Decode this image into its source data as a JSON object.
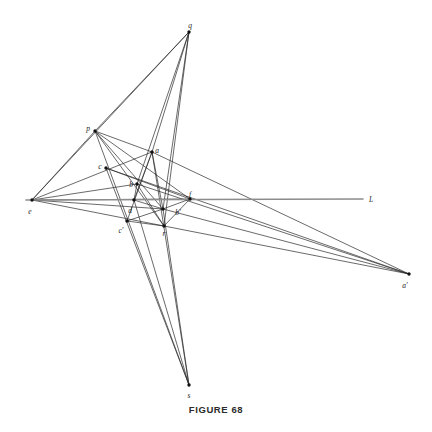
{
  "figure": {
    "caption": "FIGURE 68",
    "background_color": "#ffffff",
    "stroke_color": "#2a2a2a",
    "baseline_color": "#8c8c8c",
    "node_color": "#111111",
    "width": 432,
    "height": 432
  },
  "points": [
    {
      "id": "q",
      "label": "q",
      "x": 189,
      "y": 32,
      "lx": 190,
      "ly": 25
    },
    {
      "id": "p",
      "label": "p",
      "x": 95,
      "y": 131,
      "lx": 88,
      "ly": 128
    },
    {
      "id": "a",
      "label": "a",
      "x": 152,
      "y": 152,
      "lx": 157,
      "ly": 150
    },
    {
      "id": "c",
      "label": "c",
      "x": 106,
      "y": 168,
      "lx": 100,
      "ly": 166
    },
    {
      "id": "b",
      "label": "b",
      "x": 137,
      "y": 184,
      "lx": 131,
      "ly": 184
    },
    {
      "id": "f",
      "label": "f",
      "x": 190,
      "y": 199,
      "lx": 190,
      "ly": 194
    },
    {
      "id": "e",
      "label": "e",
      "x": 32,
      "y": 200,
      "lx": 30,
      "ly": 211
    },
    {
      "id": "d",
      "label": "d",
      "x": 134,
      "y": 200,
      "lx": 130,
      "ly": 210
    },
    {
      "id": "bp",
      "label": "b'",
      "x": 163,
      "y": 209,
      "lx": 178,
      "ly": 212
    },
    {
      "id": "cp",
      "label": "c'",
      "x": 127,
      "y": 221,
      "lx": 121,
      "ly": 230
    },
    {
      "id": "r",
      "label": "r",
      "x": 164,
      "y": 226,
      "lx": 164,
      "ly": 233
    },
    {
      "id": "ap",
      "label": "a'",
      "x": 409,
      "y": 274,
      "lx": 405,
      "ly": 285
    },
    {
      "id": "s",
      "label": "s",
      "x": 189,
      "y": 385,
      "lx": 189,
      "ly": 395
    }
  ],
  "baseline": {
    "id": "L",
    "label": "L",
    "x1": 26,
    "y1": 200,
    "x2": 363,
    "y2": 199,
    "lx": 371,
    "ly": 199
  },
  "segments": [
    {
      "id": "q-p",
      "from": "q",
      "to": "p"
    },
    {
      "id": "q-e",
      "from": "q",
      "to": "e"
    },
    {
      "id": "q-a",
      "from": "q",
      "to": "a"
    },
    {
      "id": "q-b",
      "from": "q",
      "to": "b"
    },
    {
      "id": "q-bp",
      "from": "q",
      "to": "bp"
    },
    {
      "id": "q-r",
      "from": "q",
      "to": "r"
    },
    {
      "id": "p-e",
      "from": "p",
      "to": "e"
    },
    {
      "id": "p-a",
      "from": "p",
      "to": "a"
    },
    {
      "id": "p-f",
      "from": "p",
      "to": "f"
    },
    {
      "id": "p-bp",
      "from": "p",
      "to": "bp"
    },
    {
      "id": "p-r",
      "from": "p",
      "to": "r"
    },
    {
      "id": "p-s",
      "from": "p",
      "to": "s"
    },
    {
      "id": "e-a",
      "from": "e",
      "to": "a"
    },
    {
      "id": "e-b",
      "from": "e",
      "to": "b"
    },
    {
      "id": "e-f",
      "from": "e",
      "to": "f"
    },
    {
      "id": "e-bp",
      "from": "e",
      "to": "bp"
    },
    {
      "id": "e-r",
      "from": "e",
      "to": "r"
    },
    {
      "id": "a-ap",
      "from": "a",
      "to": "ap"
    },
    {
      "id": "a-d",
      "from": "a",
      "to": "d"
    },
    {
      "id": "a-cp",
      "from": "a",
      "to": "cp"
    },
    {
      "id": "a-bp",
      "from": "a",
      "to": "bp"
    },
    {
      "id": "a-s",
      "from": "a",
      "to": "s"
    },
    {
      "id": "c-ap",
      "from": "c",
      "to": "ap"
    },
    {
      "id": "c-f",
      "from": "c",
      "to": "f"
    },
    {
      "id": "b-ap",
      "from": "b",
      "to": "ap"
    },
    {
      "id": "b-d",
      "from": "b",
      "to": "d"
    },
    {
      "id": "b-r",
      "from": "b",
      "to": "r"
    },
    {
      "id": "d-bp",
      "from": "d",
      "to": "bp"
    },
    {
      "id": "cp-bp",
      "from": "cp",
      "to": "bp"
    },
    {
      "id": "bp-ap",
      "from": "bp",
      "to": "ap"
    },
    {
      "id": "r-ap",
      "from": "r",
      "to": "ap"
    },
    {
      "id": "f-bp",
      "from": "f",
      "to": "bp"
    },
    {
      "id": "f-r",
      "from": "f",
      "to": "r"
    },
    {
      "id": "cp-r",
      "from": "cp",
      "to": "r"
    },
    {
      "id": "c-s",
      "from": "c",
      "to": "s"
    },
    {
      "id": "d-s",
      "from": "d",
      "to": "s"
    },
    {
      "id": "bp-s",
      "from": "bp",
      "to": "s"
    }
  ]
}
